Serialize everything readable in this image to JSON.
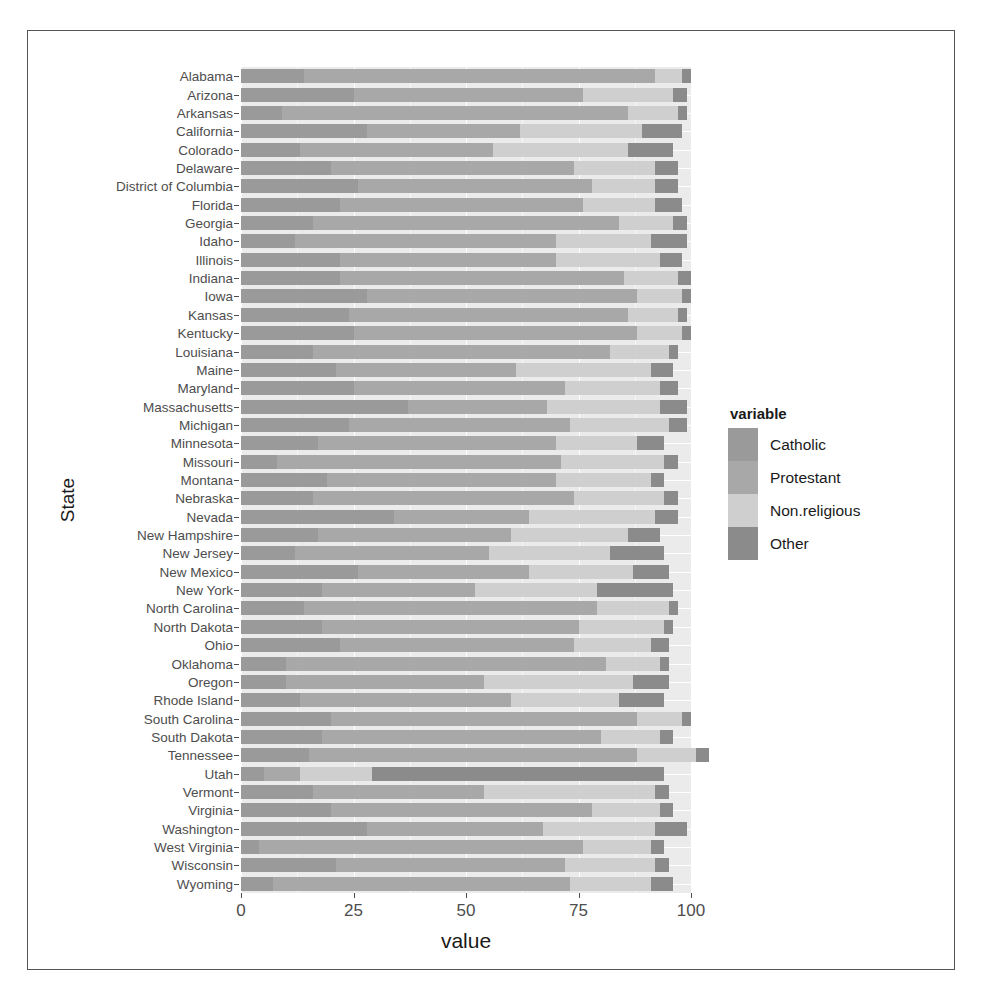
{
  "axis": {
    "x_title": "value",
    "y_title": "State",
    "x_ticks": [
      "0",
      "25",
      "50",
      "75",
      "100"
    ]
  },
  "legend": {
    "title": "variable",
    "items": [
      {
        "label": "Catholic",
        "color": "#9a9a9a"
      },
      {
        "label": "Protestant",
        "color": "#a8a8a8"
      },
      {
        "label": "Non.religious",
        "color": "#cfcfcf"
      },
      {
        "label": "Other",
        "color": "#8b8b8b"
      }
    ]
  },
  "chart_data": {
    "type": "bar",
    "orientation": "horizontal",
    "stacked": true,
    "title": "",
    "xlabel": "value",
    "ylabel": "State",
    "xlim": [
      0,
      100
    ],
    "grid": true,
    "legend_position": "right",
    "series": [
      {
        "name": "Catholic",
        "color": "#9a9a9a",
        "values": [
          7,
          21,
          4,
          28,
          20,
          16,
          5,
          15,
          18,
          20,
          13,
          10,
          10,
          22,
          18,
          14,
          18,
          26,
          12,
          17,
          34,
          16,
          19,
          8,
          17,
          24,
          37,
          25,
          21,
          16,
          25,
          24,
          28,
          22,
          22,
          12,
          16,
          22,
          26,
          20,
          13,
          28,
          9,
          25,
          14
        ]
      },
      {
        "name": "Protestant",
        "color": "#a8a8a8",
        "values": [
          66,
          51,
          72,
          39,
          58,
          38,
          8,
          73,
          62,
          68,
          47,
          44,
          71,
          52,
          57,
          65,
          34,
          38,
          43,
          43,
          30,
          58,
          51,
          63,
          53,
          49,
          31,
          47,
          40,
          66,
          63,
          62,
          60,
          63,
          48,
          58,
          68,
          54,
          52,
          54,
          43,
          34,
          77,
          51,
          78
        ]
      },
      {
        "name": "Non.religious",
        "color": "#cfcfcf",
        "values": [
          18,
          20,
          15,
          25,
          15,
          38,
          16,
          13,
          13,
          10,
          24,
          33,
          12,
          17,
          19,
          16,
          27,
          23,
          27,
          26,
          28,
          20,
          21,
          23,
          18,
          22,
          25,
          21,
          30,
          13,
          10,
          11,
          10,
          12,
          23,
          21,
          12,
          16,
          14,
          18,
          30,
          27,
          11,
          20,
          6
        ]
      },
      {
        "name": "Other",
        "color": "#8b8b8b",
        "values": [
          5,
          3,
          3,
          7,
          3,
          3,
          65,
          3,
          3,
          2,
          10,
          8,
          2,
          4,
          2,
          2,
          17,
          8,
          12,
          7,
          5,
          3,
          3,
          3,
          6,
          4,
          6,
          4,
          5,
          2,
          2,
          2,
          2,
          3,
          5,
          8,
          3,
          6,
          5,
          5,
          10,
          9,
          2,
          3,
          2
        ]
      }
    ],
    "categories": [
      "Wyoming",
      "Wisconsin",
      "West Virginia",
      "Washington",
      "Virginia",
      "Vermont",
      "Utah",
      "Tennessee",
      "South Dakota",
      "South Carolina",
      "Rhode Island",
      "Oregon",
      "Oklahoma",
      "Ohio",
      "North Dakota",
      "North Carolina",
      "New York",
      "New Mexico",
      "New Jersey",
      "New Hampshire",
      "Nevada",
      "Nebraska",
      "Montana",
      "Missouri",
      "Minnesota",
      "Michigan",
      "Massachusetts",
      "Maryland",
      "Maine",
      "Louisiana",
      "Kentucky",
      "Kansas",
      "Iowa",
      "Indiana",
      "Illinois",
      "Idaho",
      "Georgia",
      "Florida",
      "District of Columbia",
      "Delaware",
      "Colorado",
      "California",
      "Arkansas",
      "Arizona",
      "Alabama"
    ]
  }
}
